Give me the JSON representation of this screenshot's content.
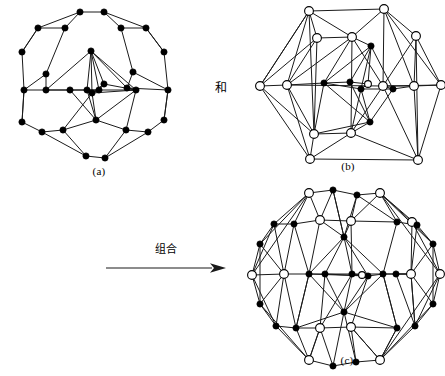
{
  "figure": {
    "conjunction_label": "和",
    "combine_label": "组合",
    "captions": {
      "a": "(a)",
      "b": "(b)",
      "c": "(c)"
    },
    "colors": {
      "edge": "#1a1a1a",
      "filled_node_fill": "#000000",
      "open_node_fill": "#ffffff",
      "node_stroke": "#000000",
      "background": "#ffffff"
    }
  },
  "graphs": {
    "a": {
      "name": "graph-a",
      "viewbox": "0 0 182 182",
      "node_style": "filled",
      "node_radius": 3.1,
      "nodes": [
        [
          72,
          10
        ],
        [
          96,
          10
        ],
        [
          30,
          26
        ],
        [
          57,
          26
        ],
        [
          113,
          26
        ],
        [
          138,
          26
        ],
        [
          14,
          50
        ],
        [
          156,
          50
        ],
        [
          83,
          49
        ],
        [
          38,
          72
        ],
        [
          125,
          70
        ],
        [
          16,
          88
        ],
        [
          38,
          88
        ],
        [
          119,
          86
        ],
        [
          96,
          82
        ],
        [
          91,
          88
        ],
        [
          79,
          88
        ],
        [
          84,
          91
        ],
        [
          62,
          88
        ],
        [
          128,
          88
        ],
        [
          160,
          88
        ],
        [
          14,
          120
        ],
        [
          156,
          118
        ],
        [
          88,
          118
        ],
        [
          34,
          130
        ],
        [
          55,
          128
        ],
        [
          118,
          128
        ],
        [
          140,
          130
        ],
        [
          78,
          154
        ],
        [
          97,
          156
        ]
      ],
      "edges": [
        [
          0,
          1
        ],
        [
          0,
          2
        ],
        [
          1,
          5
        ],
        [
          0,
          3
        ],
        [
          1,
          4
        ],
        [
          2,
          3
        ],
        [
          2,
          6
        ],
        [
          5,
          4
        ],
        [
          5,
          7
        ],
        [
          3,
          9
        ],
        [
          4,
          10
        ],
        [
          6,
          11
        ],
        [
          7,
          20
        ],
        [
          9,
          12
        ],
        [
          10,
          13
        ],
        [
          11,
          12
        ],
        [
          12,
          18
        ],
        [
          18,
          16
        ],
        [
          16,
          19
        ],
        [
          19,
          13
        ],
        [
          13,
          20
        ],
        [
          11,
          21
        ],
        [
          20,
          22
        ],
        [
          21,
          24
        ],
        [
          22,
          27
        ],
        [
          24,
          25
        ],
        [
          25,
          28
        ],
        [
          28,
          29
        ],
        [
          29,
          26
        ],
        [
          26,
          27
        ],
        [
          8,
          17
        ],
        [
          8,
          16
        ],
        [
          8,
          19
        ],
        [
          8,
          15
        ],
        [
          8,
          14
        ],
        [
          23,
          17
        ],
        [
          23,
          16
        ],
        [
          23,
          19
        ],
        [
          23,
          18
        ],
        [
          17,
          16
        ],
        [
          17,
          15
        ],
        [
          17,
          14
        ],
        [
          17,
          19
        ],
        [
          16,
          15
        ],
        [
          15,
          14
        ],
        [
          14,
          19
        ],
        [
          25,
          17
        ],
        [
          26,
          19
        ],
        [
          24,
          28
        ],
        [
          27,
          29
        ],
        [
          12,
          16
        ],
        [
          13,
          19
        ],
        [
          9,
          11
        ],
        [
          10,
          20
        ],
        [
          6,
          2
        ],
        [
          7,
          5
        ],
        [
          21,
          11
        ],
        [
          22,
          20
        ],
        [
          8,
          12
        ],
        [
          8,
          13
        ],
        [
          23,
          25
        ],
        [
          23,
          26
        ]
      ]
    },
    "b": {
      "name": "graph-b",
      "viewbox": "0 0 192 182",
      "node_radius": 4.4,
      "inner_node_radius": 3.1,
      "nodes": [
        {
          "x": 132,
          "y": 9,
          "style": "open"
        },
        {
          "x": 57,
          "y": 11,
          "style": "open"
        },
        {
          "x": 164,
          "y": 36,
          "style": "open"
        },
        {
          "x": 100,
          "y": 37,
          "style": "open"
        },
        {
          "x": 189,
          "y": 85,
          "style": "open"
        },
        {
          "x": 65,
          "y": 38,
          "style": "open"
        },
        {
          "x": 8,
          "y": 86,
          "style": "open"
        },
        {
          "x": 35,
          "y": 85,
          "style": "open"
        },
        {
          "x": 162,
          "y": 86,
          "style": "open"
        },
        {
          "x": 131,
          "y": 86,
          "style": "open"
        },
        {
          "x": 99,
          "y": 133,
          "style": "open"
        },
        {
          "x": 62,
          "y": 134,
          "style": "open"
        },
        {
          "x": 166,
          "y": 160,
          "style": "open"
        },
        {
          "x": 58,
          "y": 159,
          "style": "open"
        },
        {
          "x": 119,
          "y": 46,
          "style": "filled"
        },
        {
          "x": 72,
          "y": 83,
          "style": "filled"
        },
        {
          "x": 98,
          "y": 82,
          "style": "filled"
        },
        {
          "x": 116,
          "y": 84,
          "style": "open-small"
        },
        {
          "x": 109,
          "y": 89,
          "style": "filled"
        },
        {
          "x": 141,
          "y": 89,
          "style": "filled"
        },
        {
          "x": 118,
          "y": 122,
          "style": "filled"
        }
      ],
      "edges": [
        [
          1,
          0
        ],
        [
          1,
          7
        ],
        [
          1,
          6
        ],
        [
          1,
          5
        ],
        [
          1,
          3
        ],
        [
          1,
          11
        ],
        [
          0,
          2
        ],
        [
          0,
          3
        ],
        [
          0,
          9
        ],
        [
          0,
          8
        ],
        [
          0,
          4
        ],
        [
          2,
          4
        ],
        [
          2,
          8
        ],
        [
          2,
          9
        ],
        [
          4,
          8
        ],
        [
          4,
          12
        ],
        [
          4,
          9
        ],
        [
          6,
          7
        ],
        [
          6,
          11
        ],
        [
          6,
          13
        ],
        [
          6,
          5
        ],
        [
          7,
          5
        ],
        [
          7,
          11
        ],
        [
          7,
          13
        ],
        [
          7,
          3
        ],
        [
          5,
          3
        ],
        [
          5,
          11
        ],
        [
          3,
          9
        ],
        [
          3,
          14
        ],
        [
          9,
          8
        ],
        [
          9,
          10
        ],
        [
          9,
          12
        ],
        [
          8,
          12
        ],
        [
          11,
          13
        ],
        [
          11,
          10
        ],
        [
          11,
          15
        ],
        [
          13,
          10
        ],
        [
          13,
          12
        ],
        [
          10,
          12
        ],
        [
          10,
          20
        ],
        [
          14,
          15
        ],
        [
          14,
          16
        ],
        [
          14,
          17
        ],
        [
          14,
          18
        ],
        [
          14,
          19
        ],
        [
          20,
          15
        ],
        [
          20,
          16
        ],
        [
          20,
          18
        ],
        [
          20,
          19
        ],
        [
          15,
          16
        ],
        [
          16,
          17
        ],
        [
          17,
          18
        ],
        [
          18,
          19
        ],
        [
          15,
          18
        ],
        [
          7,
          15
        ],
        [
          19,
          8
        ],
        [
          3,
          15
        ],
        [
          9,
          19
        ],
        [
          11,
          20
        ],
        [
          10,
          18
        ],
        [
          2,
          12
        ],
        [
          6,
          1
        ],
        [
          7,
          9
        ],
        [
          3,
          10
        ]
      ]
    },
    "c": {
      "name": "graph-c",
      "viewbox": "0 0 194 194",
      "node_radius_open": 4.4,
      "node_radius_filled": 3.1,
      "nodes": [
        {
          "x": 130,
          "y": 11,
          "style": "open"
        },
        {
          "x": 59,
          "y": 11,
          "style": "open"
        },
        {
          "x": 83,
          "y": 8,
          "style": "filled"
        },
        {
          "x": 107,
          "y": 13,
          "style": "filled"
        },
        {
          "x": 162,
          "y": 40,
          "style": "open"
        },
        {
          "x": 101,
          "y": 39,
          "style": "open"
        },
        {
          "x": 24,
          "y": 42,
          "style": "filled"
        },
        {
          "x": 44,
          "y": 42,
          "style": "filled"
        },
        {
          "x": 147,
          "y": 40,
          "style": "filled"
        },
        {
          "x": 167,
          "y": 43,
          "style": "filled"
        },
        {
          "x": 70,
          "y": 38,
          "style": "open"
        },
        {
          "x": 10,
          "y": 62,
          "style": "filled"
        },
        {
          "x": 183,
          "y": 62,
          "style": "filled"
        },
        {
          "x": 94,
          "y": 55,
          "style": "filled"
        },
        {
          "x": 2,
          "y": 93,
          "style": "open"
        },
        {
          "x": 34,
          "y": 92,
          "style": "open"
        },
        {
          "x": 161,
          "y": 92,
          "style": "open"
        },
        {
          "x": 190,
          "y": 92,
          "style": "open"
        },
        {
          "x": 59,
          "y": 92,
          "style": "filled"
        },
        {
          "x": 75,
          "y": 92,
          "style": "filled"
        },
        {
          "x": 102,
          "y": 92,
          "style": "filled"
        },
        {
          "x": 118,
          "y": 94,
          "style": "filled"
        },
        {
          "x": 133,
          "y": 92,
          "style": "filled"
        },
        {
          "x": 146,
          "y": 92,
          "style": "filled"
        },
        {
          "x": 112,
          "y": 93,
          "style": "open-small"
        },
        {
          "x": 10,
          "y": 122,
          "style": "filled"
        },
        {
          "x": 183,
          "y": 122,
          "style": "filled"
        },
        {
          "x": 94,
          "y": 130,
          "style": "filled"
        },
        {
          "x": 26,
          "y": 144,
          "style": "filled"
        },
        {
          "x": 46,
          "y": 146,
          "style": "filled"
        },
        {
          "x": 70,
          "y": 146,
          "style": "open"
        },
        {
          "x": 101,
          "y": 145,
          "style": "open"
        },
        {
          "x": 147,
          "y": 146,
          "style": "filled"
        },
        {
          "x": 165,
          "y": 144,
          "style": "filled"
        },
        {
          "x": 59,
          "y": 178,
          "style": "open"
        },
        {
          "x": 130,
          "y": 178,
          "style": "open"
        },
        {
          "x": 83,
          "y": 184,
          "style": "filled"
        },
        {
          "x": 106,
          "y": 180,
          "style": "filled"
        }
      ],
      "edges": [
        [
          1,
          2
        ],
        [
          2,
          3
        ],
        [
          3,
          0
        ],
        [
          1,
          10
        ],
        [
          1,
          7
        ],
        [
          1,
          6
        ],
        [
          1,
          11
        ],
        [
          1,
          14
        ],
        [
          0,
          4
        ],
        [
          0,
          8
        ],
        [
          0,
          9
        ],
        [
          0,
          12
        ],
        [
          0,
          17
        ],
        [
          0,
          5
        ],
        [
          4,
          9
        ],
        [
          4,
          12
        ],
        [
          4,
          16
        ],
        [
          4,
          17
        ],
        [
          6,
          7
        ],
        [
          6,
          11
        ],
        [
          6,
          14
        ],
        [
          6,
          15
        ],
        [
          11,
          14
        ],
        [
          11,
          15
        ],
        [
          11,
          25
        ],
        [
          14,
          15
        ],
        [
          14,
          25
        ],
        [
          14,
          28
        ],
        [
          25,
          28
        ],
        [
          25,
          15
        ],
        [
          25,
          34
        ],
        [
          28,
          29
        ],
        [
          28,
          34
        ],
        [
          28,
          15
        ],
        [
          29,
          34
        ],
        [
          29,
          30
        ],
        [
          29,
          18
        ],
        [
          34,
          36
        ],
        [
          36,
          37
        ],
        [
          37,
          35
        ],
        [
          35,
          33
        ],
        [
          35,
          32
        ],
        [
          35,
          26
        ],
        [
          35,
          17
        ],
        [
          35,
          31
        ],
        [
          33,
          26
        ],
        [
          33,
          16
        ],
        [
          33,
          17
        ],
        [
          26,
          16
        ],
        [
          26,
          17
        ],
        [
          26,
          12
        ],
        [
          12,
          16
        ],
        [
          12,
          17
        ],
        [
          12,
          9
        ],
        [
          16,
          9
        ],
        [
          16,
          23
        ],
        [
          16,
          22
        ],
        [
          9,
          8
        ],
        [
          8,
          5
        ],
        [
          8,
          22
        ],
        [
          5,
          10
        ],
        [
          5,
          13
        ],
        [
          5,
          3
        ],
        [
          10,
          7
        ],
        [
          10,
          18
        ],
        [
          10,
          13
        ],
        [
          7,
          18
        ],
        [
          7,
          15
        ],
        [
          18,
          19
        ],
        [
          19,
          20
        ],
        [
          20,
          24
        ],
        [
          24,
          21
        ],
        [
          21,
          22
        ],
        [
          22,
          23
        ],
        [
          13,
          18
        ],
        [
          13,
          19
        ],
        [
          13,
          20
        ],
        [
          13,
          21
        ],
        [
          13,
          22
        ],
        [
          27,
          18
        ],
        [
          27,
          19
        ],
        [
          27,
          20
        ],
        [
          27,
          21
        ],
        [
          27,
          22
        ],
        [
          19,
          21
        ],
        [
          20,
          22
        ],
        [
          18,
          21
        ],
        [
          30,
          19
        ],
        [
          31,
          21
        ],
        [
          32,
          22
        ],
        [
          30,
          31
        ],
        [
          31,
          32
        ],
        [
          15,
          18
        ],
        [
          23,
          16
        ],
        [
          29,
          27
        ],
        [
          32,
          27
        ],
        [
          34,
          30
        ],
        [
          35,
          32
        ],
        [
          31,
          35
        ],
        [
          30,
          34
        ],
        [
          10,
          2
        ],
        [
          8,
          3
        ],
        [
          5,
          20
        ],
        [
          13,
          2
        ],
        [
          27,
          36
        ],
        [
          27,
          37
        ],
        [
          15,
          29
        ],
        [
          16,
          33
        ],
        [
          20,
          30
        ],
        [
          22,
          32
        ],
        [
          2,
          13
        ],
        [
          3,
          13
        ],
        [
          18,
          29
        ],
        [
          23,
          33
        ],
        [
          36,
          30
        ],
        [
          37,
          31
        ]
      ]
    }
  }
}
